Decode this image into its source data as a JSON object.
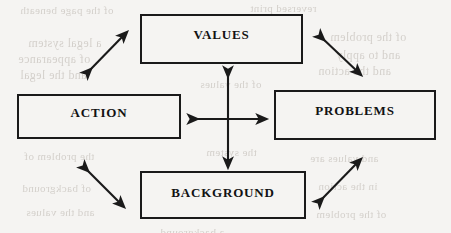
{
  "diagram": {
    "canvas": {
      "width": 451,
      "height": 233,
      "background_color": "#f5f4f2"
    },
    "stroke_color": "#1a1a1a",
    "text_color": "#121212",
    "nodes": [
      {
        "id": "values",
        "label": "VALUES",
        "x": 140,
        "y": 14,
        "width": 163,
        "height": 50
      },
      {
        "id": "action",
        "label": "ACTION",
        "x": 17,
        "y": 94,
        "width": 164,
        "height": 45
      },
      {
        "id": "problems",
        "label": "PROBLEMS",
        "x": 274,
        "y": 90,
        "width": 162,
        "height": 50
      },
      {
        "id": "background",
        "label": "BACKGROUND",
        "x": 140,
        "y": 171,
        "width": 166,
        "height": 48
      }
    ],
    "connectors": [
      {
        "id": "action-values",
        "from": "action",
        "to": "values",
        "style": "double-headed-diagonal",
        "x1": 88,
        "y1": 72,
        "x2": 124,
        "y2": 35
      },
      {
        "id": "values-problems",
        "from": "values",
        "to": "problems",
        "style": "double-headed-diagonal",
        "x1": 321,
        "y1": 37,
        "x2": 358,
        "y2": 72
      },
      {
        "id": "action-background",
        "from": "action",
        "to": "background",
        "style": "double-headed-diagonal",
        "x1": 85,
        "y1": 168,
        "x2": 121,
        "y2": 204
      },
      {
        "id": "background-problems",
        "from": "background",
        "to": "problems",
        "style": "double-headed-diagonal",
        "x1": 320,
        "y1": 201,
        "x2": 358,
        "y2": 162
      },
      {
        "id": "center-vertical",
        "from": "values",
        "to": "background",
        "style": "double-headed-vertical",
        "x1": 228,
        "y1": 72,
        "x2": 228,
        "y2": 163
      },
      {
        "id": "center-horizontal",
        "from": "action",
        "to": "problems",
        "style": "double-headed-horizontal",
        "x1": 193,
        "y1": 119,
        "x2": 262,
        "y2": 119
      }
    ]
  },
  "ghost_text": {
    "note": "Faint mirrored show-through from the reverse side of the scanned page; illegible.",
    "lines": [
      {
        "text": "of the page beneath",
        "x": 20,
        "y": 4,
        "size": 11
      },
      {
        "text": "reversed print",
        "x": 250,
        "y": 2,
        "size": 11
      },
      {
        "text": "a legal system",
        "x": 28,
        "y": 36,
        "size": 12
      },
      {
        "text": "of appearance",
        "x": 18,
        "y": 52,
        "size": 12
      },
      {
        "text": "and the legal",
        "x": 20,
        "y": 68,
        "size": 12
      },
      {
        "text": "of the problem",
        "x": 330,
        "y": 30,
        "size": 12
      },
      {
        "text": "and to apply",
        "x": 336,
        "y": 48,
        "size": 12
      },
      {
        "text": "and the action",
        "x": 318,
        "y": 64,
        "size": 12
      },
      {
        "text": "of the values",
        "x": 200,
        "y": 78,
        "size": 11
      },
      {
        "text": "the system",
        "x": 206,
        "y": 146,
        "size": 11
      },
      {
        "text": "the problem of",
        "x": 24,
        "y": 150,
        "size": 11
      },
      {
        "text": "and values are",
        "x": 310,
        "y": 152,
        "size": 11
      },
      {
        "text": "of background",
        "x": 22,
        "y": 182,
        "size": 11
      },
      {
        "text": "in the action",
        "x": 318,
        "y": 180,
        "size": 11
      },
      {
        "text": "and the values",
        "x": 26,
        "y": 206,
        "size": 11
      },
      {
        "text": "of the problem",
        "x": 316,
        "y": 208,
        "size": 11
      },
      {
        "text": "a background",
        "x": 160,
        "y": 226,
        "size": 11
      }
    ]
  }
}
